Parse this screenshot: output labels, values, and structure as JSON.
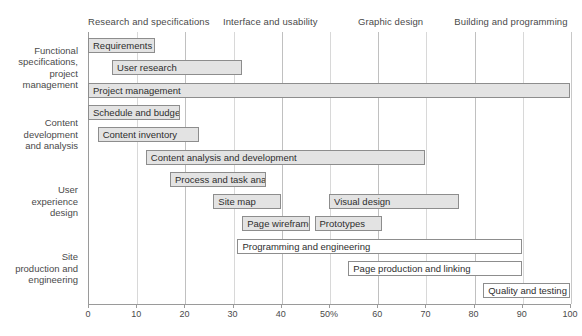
{
  "chart_data": {
    "type": "bar",
    "title": "",
    "xlabel": "",
    "ylabel": "",
    "xlim": [
      0,
      100
    ],
    "xticks": [
      0,
      10,
      20,
      30,
      40,
      50,
      60,
      70,
      80,
      90,
      100
    ],
    "xtick_labels": [
      "0",
      "10",
      "20",
      "30",
      "40",
      "50%",
      "60",
      "70",
      "80",
      "90",
      "100"
    ],
    "grid": true,
    "legend": "none",
    "orientation": "horizontal",
    "phases": [
      {
        "label": "Research and specifications",
        "x": 0
      },
      {
        "label": "Interface and usability",
        "x": 28
      },
      {
        "label": "Graphic design",
        "x": 56
      },
      {
        "label": "Building and programming",
        "x": 76
      }
    ],
    "groups": [
      {
        "label": "Functional\nspecifications,\nproject\nmanagement"
      },
      {
        "label": "Content\ndevelopment\nand analysis"
      },
      {
        "label": "User\nexperience\ndesign"
      },
      {
        "label": "Site\nproduction and\nengineering"
      }
    ],
    "tasks": [
      {
        "name": "Requirements",
        "start": 0,
        "end": 14,
        "group": 0,
        "row": 0,
        "style": "filled"
      },
      {
        "name": "User research",
        "start": 5,
        "end": 32,
        "group": 0,
        "row": 1,
        "style": "filled"
      },
      {
        "name": "Project management",
        "start": 0,
        "end": 100,
        "group": 0,
        "row": 2,
        "style": "filled"
      },
      {
        "name": "Schedule and budget",
        "start": 0,
        "end": 19,
        "group": 1,
        "row": 3,
        "style": "filled"
      },
      {
        "name": "Content inventory",
        "start": 2,
        "end": 23,
        "group": 1,
        "row": 4,
        "style": "filled"
      },
      {
        "name": "Content analysis and development",
        "start": 12,
        "end": 70,
        "group": 1,
        "row": 5,
        "style": "filled"
      },
      {
        "name": "Process and task analysis",
        "start": 17,
        "end": 37,
        "group": 2,
        "row": 6,
        "style": "filled"
      },
      {
        "name": "Site map",
        "start": 26,
        "end": 40,
        "group": 2,
        "row": 7,
        "style": "filled"
      },
      {
        "name": "Visual design",
        "start": 50,
        "end": 77,
        "group": 2,
        "row": 7,
        "style": "filled"
      },
      {
        "name": "Page wireframes",
        "start": 32,
        "end": 46,
        "group": 2,
        "row": 8,
        "style": "filled"
      },
      {
        "name": "Prototypes",
        "start": 47,
        "end": 61,
        "group": 2,
        "row": 8,
        "style": "filled"
      },
      {
        "name": "Programming and engineering",
        "start": 31,
        "end": 90,
        "group": 3,
        "row": 9,
        "style": "hollow"
      },
      {
        "name": "Page production and linking",
        "start": 54,
        "end": 90,
        "group": 3,
        "row": 10,
        "style": "hollow"
      },
      {
        "name": "Quality and testing",
        "start": 82,
        "end": 100,
        "group": 3,
        "row": 11,
        "style": "hollow"
      }
    ]
  },
  "colors": {
    "bar_fill": "#e3e3e3",
    "bar_fill_hollow": "#ffffff",
    "bar_border": "#8d8d8d",
    "grid": "#d8d8d8",
    "axis": "#9a9a9a",
    "text": "#4a4a4a"
  }
}
